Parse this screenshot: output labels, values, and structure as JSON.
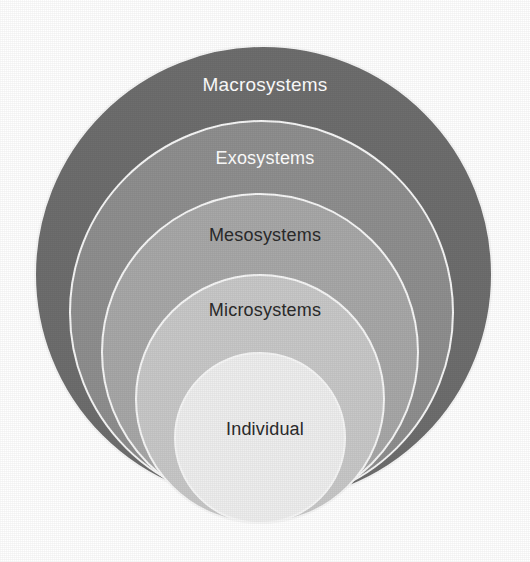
{
  "diagram": {
    "type": "nested-circles",
    "background_color": "#ffffff",
    "border_color": "#f7f7f7",
    "layers": [
      {
        "id": "macrosystems",
        "label": "Macrosystems",
        "level": 1,
        "fill_color": "#6e6e6e",
        "text_color": "#ffffff",
        "font_size_px": 19,
        "diameter_px": 459,
        "center_x_px": 263,
        "top_px": 45,
        "label_y_px": 74
      },
      {
        "id": "exosystems",
        "label": "Exosystems",
        "level": 2,
        "fill_color": "#8f8f8f",
        "text_color": "#ffffff",
        "font_size_px": 18,
        "diameter_px": 385,
        "center_x_px": 261,
        "top_px": 120,
        "label_y_px": 148
      },
      {
        "id": "mesosystems",
        "label": "Mesosystems",
        "level": 3,
        "fill_color": "#a8a8a8",
        "text_color": "#2b2b2b",
        "font_size_px": 18,
        "diameter_px": 318,
        "center_x_px": 260,
        "top_px": 193,
        "label_y_px": 225
      },
      {
        "id": "microsystems",
        "label": "Microsystems",
        "level": 4,
        "fill_color": "#c8c8c8",
        "text_color": "#2b2b2b",
        "font_size_px": 18,
        "diameter_px": 250,
        "center_x_px": 260,
        "top_px": 274,
        "label_y_px": 300
      },
      {
        "id": "individual",
        "label": "Individual",
        "level": 5,
        "fill_color": "#eeeeee",
        "text_color": "#2b2b2b",
        "font_size_px": 18,
        "diameter_px": 172,
        "center_x_px": 260,
        "top_px": 352,
        "label_y_px": 419
      }
    ]
  },
  "chart_data": {
    "type": "diagram",
    "categories": [
      "Macrosystems",
      "Exosystems",
      "Mesosystems",
      "Microsystems",
      "Individual"
    ],
    "values": [
      459,
      385,
      318,
      250,
      172
    ],
    "xlabel": "",
    "ylabel": "Circle diameter (px)",
    "legend": []
  }
}
